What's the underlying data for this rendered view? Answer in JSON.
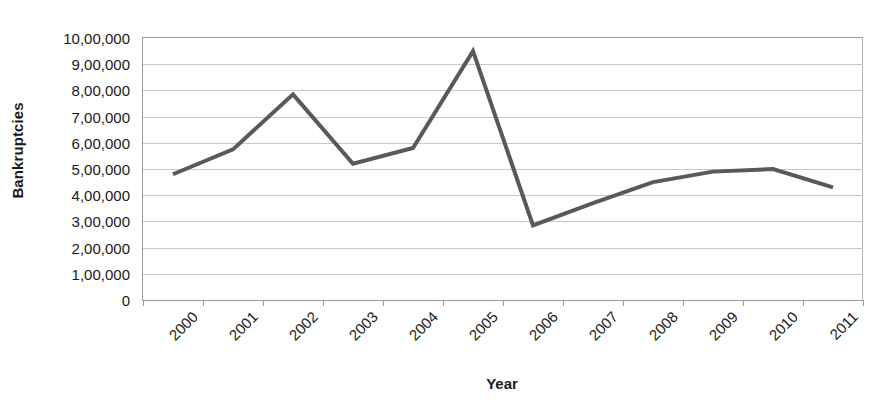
{
  "chart_data": {
    "type": "line",
    "title": "",
    "xlabel": "Year",
    "ylabel": "Bankruptcies",
    "categories": [
      "2000",
      "2001",
      "2002",
      "2003",
      "2004",
      "2005",
      "2006",
      "2007",
      "2008",
      "2009",
      "2010",
      "2011"
    ],
    "values": [
      480000,
      575000,
      785000,
      520000,
      580000,
      950000,
      285000,
      370000,
      450000,
      490000,
      500000,
      430000
    ],
    "series": [
      {
        "name": "Bankruptcies",
        "values": [
          480000,
          575000,
          785000,
          520000,
          580000,
          950000,
          285000,
          370000,
          450000,
          490000,
          500000,
          430000
        ]
      }
    ],
    "ylim": [
      0,
      1000000
    ],
    "y_tick_values": [
      0,
      100000,
      200000,
      300000,
      400000,
      500000,
      600000,
      700000,
      800000,
      900000,
      1000000
    ],
    "y_tick_labels": [
      "0",
      "1,00,000",
      "2,00,000",
      "3,00,000",
      "4,00,000",
      "5,00,000",
      "6,00,000",
      "7,00,000",
      "8,00,000",
      "9,00,000",
      "10,00,000"
    ],
    "grid": true,
    "legend": false,
    "legend_position": "none",
    "x_label_rotation": -45,
    "line_color": "#595959",
    "gridline_color": "#c8c8c8",
    "axis_color": "#9a9a9a",
    "background_color": "#ffffff",
    "line_width": 4,
    "markers": false
  }
}
